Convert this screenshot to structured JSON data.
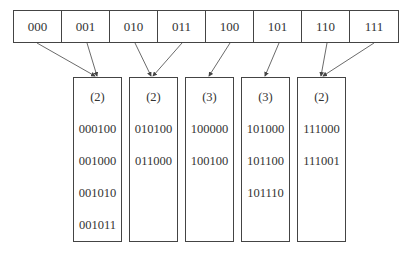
{
  "directory": {
    "entries": [
      "000",
      "001",
      "010",
      "011",
      "100",
      "101",
      "110",
      "111"
    ]
  },
  "buckets": [
    {
      "local_depth": "(2)",
      "keys": [
        "000100",
        "001000",
        "001010",
        "001011"
      ],
      "pointed_by": [
        "000",
        "001"
      ]
    },
    {
      "local_depth": "(2)",
      "keys": [
        "010100",
        "011000"
      ],
      "pointed_by": [
        "010",
        "011"
      ]
    },
    {
      "local_depth": "(3)",
      "keys": [
        "100000",
        "100100"
      ],
      "pointed_by": [
        "100"
      ]
    },
    {
      "local_depth": "(3)",
      "keys": [
        "101000",
        "101100",
        "101110"
      ],
      "pointed_by": [
        "101"
      ]
    },
    {
      "local_depth": "(2)",
      "keys": [
        "111000",
        "111001"
      ],
      "pointed_by": [
        "110",
        "111"
      ]
    }
  ],
  "colors": {
    "line": "#444444",
    "text": "#333333",
    "background": "#ffffff"
  }
}
